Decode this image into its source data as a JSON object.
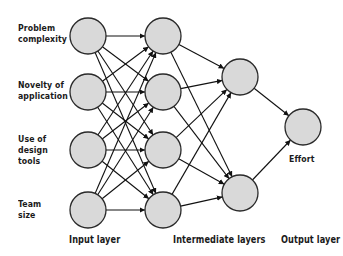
{
  "diagram": {
    "type": "neural-network",
    "colors": {
      "node_fill": "#d9d9d9",
      "node_stroke": "#2a2a2a",
      "edge": "#111111",
      "text": "#1a1a1a",
      "background": "#ffffff"
    },
    "input_labels": [
      {
        "line1": "Problem",
        "line2": "complexity",
        "line3": ""
      },
      {
        "line1": "Novelty of",
        "line2": "application",
        "line3": ""
      },
      {
        "line1": "Use of",
        "line2": "design",
        "line3": "tools"
      },
      {
        "line1": "Team",
        "line2": "size",
        "line3": ""
      }
    ],
    "output_label": "Effort",
    "layer_labels": {
      "input": "Input layer",
      "intermediate": "Intermediate layers",
      "output": "Output layer"
    },
    "layers": [
      {
        "name": "input",
        "nodes": 4
      },
      {
        "name": "intermediate-1",
        "nodes": 4
      },
      {
        "name": "intermediate-2",
        "nodes": 2
      },
      {
        "name": "output",
        "nodes": 1
      }
    ],
    "connections": "fully-connected between consecutive layers, with arrowheads at target nodes"
  }
}
